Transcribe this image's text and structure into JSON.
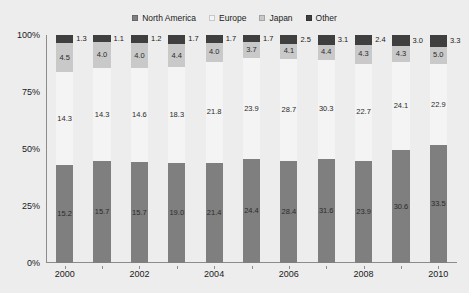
{
  "chart_data": {
    "type": "bar",
    "stacked": true,
    "normalized_axis": "percent",
    "title": "",
    "subtitle": "",
    "xlabel": "",
    "ylabel": "",
    "ylim": [
      0,
      100
    ],
    "ytick_labels": [
      "0%",
      "25%",
      "50%",
      "75%",
      "100%"
    ],
    "ytick_values": [
      0,
      25,
      50,
      75,
      100
    ],
    "grid": false,
    "legend_position": "top-center",
    "categories": [
      "2000",
      "2001",
      "2002",
      "2003",
      "2004",
      "2005",
      "2006",
      "2007",
      "2008",
      "2009",
      "2010"
    ],
    "xtick_labels_shown": [
      "2000",
      "",
      "2002",
      "",
      "2004",
      "",
      "2006",
      "",
      "2008",
      "",
      "2010"
    ],
    "series": [
      {
        "name": "North America",
        "color": "#7f7f7f",
        "values": [
          15.2,
          15.7,
          15.7,
          19.0,
          21.4,
          24.4,
          28.4,
          31.6,
          23.9,
          30.6,
          33.5
        ]
      },
      {
        "name": "Europe",
        "color": "#f4f4f4",
        "values": [
          14.3,
          14.3,
          14.6,
          18.3,
          21.8,
          23.9,
          28.7,
          30.3,
          22.7,
          24.1,
          22.9
        ]
      },
      {
        "name": "Japan",
        "color": "#c9c9c9",
        "values": [
          4.5,
          4.0,
          4.0,
          4.4,
          4.0,
          3.7,
          4.1,
          4.4,
          4.3,
          4.3,
          5.0
        ]
      },
      {
        "name": "Other",
        "color": "#3f3f3f",
        "values": [
          1.3,
          1.1,
          1.2,
          1.7,
          1.7,
          1.7,
          2.5,
          3.1,
          2.4,
          3.0,
          3.3
        ]
      }
    ]
  },
  "legend": {
    "items": [
      {
        "label": "North America",
        "color": "#7f7f7f"
      },
      {
        "label": "Europe",
        "color": "#f4f4f4"
      },
      {
        "label": "Japan",
        "color": "#c9c9c9"
      },
      {
        "label": "Other",
        "color": "#3f3f3f"
      }
    ]
  },
  "colors": {
    "background": "#ededed",
    "axis": "#8c8c8c",
    "text": "#1a1a1a"
  }
}
